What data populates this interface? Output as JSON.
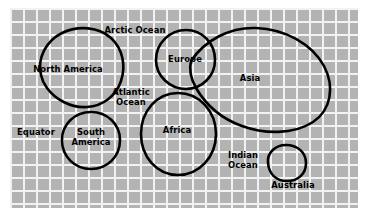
{
  "diagram": {
    "background_color": "#b3b3b3",
    "grid_line_color": "#f2f2f2",
    "outline_color": "#000000",
    "label_color": "#000000",
    "grid": {
      "cell_size_px": 13,
      "line_width_px": 2,
      "columns": 27,
      "rows": 16
    },
    "labels": [
      {
        "id": "arctic-ocean",
        "text": "Arctic Ocean",
        "x": 135,
        "y": 31,
        "lines": 1
      },
      {
        "id": "north-america",
        "text": "North America",
        "x": 68,
        "y": 70,
        "lines": 1
      },
      {
        "id": "atlantic-ocean",
        "text": "Atlantic\nOcean",
        "x": 131,
        "y": 98,
        "lines": 2
      },
      {
        "id": "europe",
        "text": "Europe",
        "x": 185,
        "y": 60,
        "lines": 1
      },
      {
        "id": "asia",
        "text": "Asia",
        "x": 250,
        "y": 79,
        "lines": 1
      },
      {
        "id": "equator",
        "text": "Equator",
        "x": 36,
        "y": 133,
        "lines": 1
      },
      {
        "id": "south-america",
        "text": "South\nAmerica",
        "x": 91,
        "y": 138,
        "lines": 2
      },
      {
        "id": "africa",
        "text": "Africa",
        "x": 177,
        "y": 131,
        "lines": 1
      },
      {
        "id": "indian-ocean",
        "text": "Indian\nOcean",
        "x": 243,
        "y": 161,
        "lines": 2
      },
      {
        "id": "australia",
        "text": "Australia",
        "x": 293,
        "y": 186,
        "lines": 1
      }
    ],
    "landmasses": [
      {
        "id": "north-america",
        "name": "North America",
        "shape": "rounded-blob",
        "path": "M 41 75 C 37 58 46 41 62 33 C 78 25 99 27 111 38 C 123 49 126 66 121 81 C 116 96 103 106 87 107 C 70 108 55 99 47 88 C 44 84 42 80 41 75 Z"
      },
      {
        "id": "south-america",
        "name": "South America",
        "shape": "circle",
        "path": "M 62 140 C 62 124 75 112 91 112 C 107 112 120 124 120 140 C 120 157 107 169 91 169 C 75 169 62 157 62 140 Z"
      },
      {
        "id": "europe",
        "name": "Europe",
        "shape": "circle",
        "path": "M 156 60 C 156 43 170 30 186 30 C 202 30 215 43 215 60 C 215 76 202 89 186 89 C 170 89 156 76 156 60 Z"
      },
      {
        "id": "asia",
        "name": "Asia",
        "shape": "tilted-ellipse",
        "path": "M 191 61 C 205 40 230 27 256 28 C 285 29 312 44 324 66 C 335 87 331 110 313 122 C 293 135 264 134 242 126 C 222 119 206 105 196 88 C 191 79 189 69 191 61 Z"
      },
      {
        "id": "africa",
        "name": "Africa",
        "shape": "circle",
        "path": "M 141 134 C 141 111 157 93 178 93 C 199 93 216 111 216 134 C 216 157 199 175 178 175 C 157 175 141 157 141 134 Z"
      },
      {
        "id": "australia",
        "name": "Australia",
        "shape": "small-rounded-blob",
        "path": "M 268 163 C 267 153 275 145 286 145 C 297 145 306 152 306 163 C 306 174 298 181 287 181 C 276 181 269 174 268 163 Z"
      }
    ]
  }
}
